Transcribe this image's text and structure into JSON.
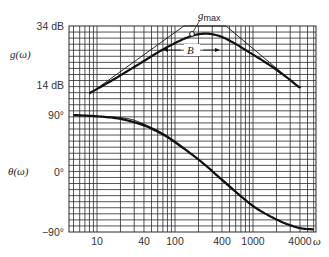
{
  "chart_data": {
    "type": "line",
    "title": "",
    "xscale": "log",
    "xlabel": "ω",
    "x_tick_labels": [
      "10",
      "40",
      "100",
      "400",
      "1000",
      "4000"
    ],
    "x_ticks": [
      10,
      40,
      100,
      400,
      1000,
      4000
    ],
    "xlim": [
      5,
      7000
    ],
    "panels": [
      {
        "name": "gain",
        "ylabel": "g(ω)",
        "y_tick_labels": [
          "34 dB",
          "14 dB"
        ],
        "y_ticks": [
          34,
          14
        ],
        "ylim": [
          9,
          34
        ],
        "series": [
          {
            "name": "g(ω) actual",
            "x": [
              8,
              15,
              30,
              60,
              100,
              150,
              200,
              250,
              300,
              400,
              600,
              1000,
              1500,
              2500,
              4000
            ],
            "y": [
              11.2,
              15.3,
              20.1,
              25.0,
              28.2,
              30.3,
              31.2,
              31.4,
              31.2,
              30.3,
              27.9,
              24.3,
              21.4,
              17.3,
              13.0
            ]
          },
          {
            "name": "asymptotes",
            "x": [
              8,
              130,
              450,
              4000
            ],
            "y": [
              11.0,
              34.0,
              34.0,
              13.0
            ]
          }
        ],
        "annotations": [
          {
            "text": "g_max",
            "x": 250,
            "y": 31.4
          },
          {
            "text": "B",
            "x_range": [
              110,
              520
            ],
            "y": 27.5
          }
        ]
      },
      {
        "name": "phase",
        "ylabel": "θ(ω)",
        "y_tick_labels": [
          "90°",
          "0°",
          "−90°"
        ],
        "y_ticks": [
          90,
          0,
          -90
        ],
        "ylim": [
          -90,
          90
        ],
        "series": [
          {
            "name": "θ(ω) actual",
            "x": [
              5,
              10,
              20,
              40,
              70,
              100,
              150,
              250,
              400,
              700,
              1000,
              1500,
              2500,
              4000,
              6000
            ],
            "y": [
              90,
              88,
              84,
              74,
              60,
              48,
              33,
              12,
              -10,
              -35,
              -50,
              -63,
              -76,
              -84,
              -86
            ]
          },
          {
            "name": "θ(ω) approximation",
            "x": [
              5,
              20,
              40,
              100,
              400,
              1000,
              3000,
              6000
            ],
            "y": [
              89,
              86,
              76,
              50,
              -8,
              -50,
              -80,
              -86
            ]
          }
        ]
      }
    ],
    "grid": true,
    "legend": "none"
  },
  "labels": {
    "gain_axis": "g(ω)",
    "phase_axis": "θ(ω)",
    "gmax": "g",
    "gmax_sub": "max",
    "bandwidth": "B",
    "omega": "ω",
    "y34": "34 dB",
    "y14": "14 dB",
    "y90": "90°",
    "y0": "0°",
    "ym90": "−90°",
    "x10": "10",
    "x40": "40",
    "x100": "100",
    "x400": "400",
    "x1000": "1000",
    "x4000": "4000"
  },
  "colors": {
    "curve": "#111111",
    "grid": "#2a2a2a",
    "text": "#333333"
  }
}
